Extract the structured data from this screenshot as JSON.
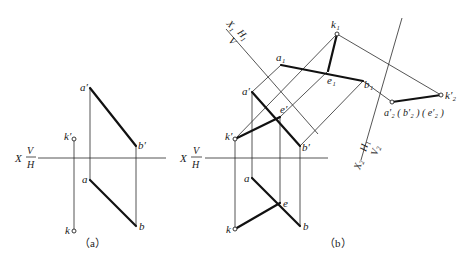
{
  "figure_a": {
    "caption": "（a）",
    "axis": {
      "x_label": "X",
      "upper": "V",
      "lower": "H"
    },
    "labels": {
      "a_prime": "a′",
      "b_prime": "b′",
      "k_prime": "k′",
      "a": "a",
      "b": "b",
      "k": "k"
    }
  },
  "figure_b": {
    "caption": "（b）",
    "axis": {
      "x_label": "X",
      "upper": "V",
      "lower": "H"
    },
    "axis_x1": {
      "x_label": "X₁",
      "upper": "H",
      "lower": "V",
      "sub": "1"
    },
    "axis_x2": {
      "x_label": "X₂",
      "upper": "H₁",
      "lower": "V₂"
    },
    "labels": {
      "a_prime": "a′",
      "b_prime": "b′",
      "e_prime": "e′",
      "k_prime": "k′",
      "a": "a",
      "b": "b",
      "e": "e",
      "k": "k",
      "a1": "a₁",
      "b1": "b₁",
      "e1": "e₁",
      "k1": "k₁",
      "a2_group": "a′₂ ( b′₂ ) ( e′₂ )",
      "k2": "k′₂"
    }
  },
  "colors": {
    "line": "#111111",
    "background": "#ffffff"
  }
}
